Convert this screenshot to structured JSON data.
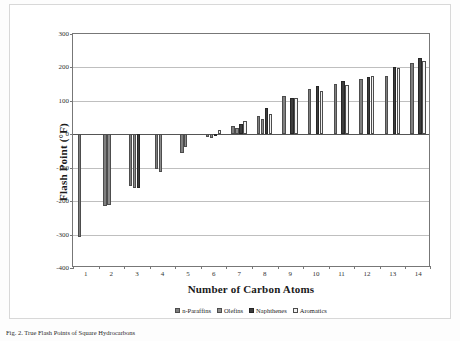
{
  "figure": {
    "caption": "Fig. 2. True Flash Points of Square Hydrocarbons"
  },
  "chart_data": {
    "type": "bar",
    "title": "",
    "xlabel": "Number of Carbon Atoms",
    "ylabel": "Flash Point (°F)",
    "categories": [
      "1",
      "2",
      "3",
      "4",
      "5",
      "6",
      "7",
      "8",
      "9",
      "10",
      "11",
      "12",
      "13",
      "14"
    ],
    "ylim": [
      -400,
      300
    ],
    "yticks": [
      300,
      200,
      100,
      0,
      -100,
      -200,
      -300,
      -400
    ],
    "ytick_labels": [
      "300",
      "200",
      "100",
      "0",
      "-100",
      "-200",
      "-300",
      "-400"
    ],
    "grid": true,
    "legend_position": "bottom",
    "series": [
      {
        "name": "n-Paraffins",
        "color": "#7f7f7f",
        "border": "#4d4d4d",
        "values": [
          -306,
          -215,
          -156,
          -105,
          -57,
          -9,
          25,
          56,
          115,
          136,
          151,
          165,
          175,
          212
        ]
      },
      {
        "name": "Olefins",
        "color": "#8c8c8c",
        "border": "#4d4d4d",
        "values": [
          null,
          -212,
          -162,
          -112,
          -38,
          -10,
          20,
          45,
          null,
          null,
          null,
          null,
          null,
          null
        ]
      },
      {
        "name": "Naphthenes",
        "color": "#3d3d3d",
        "border": "#262626",
        "values": [
          null,
          null,
          -160,
          null,
          null,
          0,
          30,
          80,
          110,
          145,
          158,
          172,
          200,
          228
        ]
      },
      {
        "name": "Aromatics",
        "color": "#f2f2f2",
        "border": "#4d4d4d",
        "values": [
          null,
          null,
          null,
          null,
          null,
          12,
          40,
          60,
          110,
          130,
          148,
          175,
          198,
          218
        ]
      }
    ]
  }
}
